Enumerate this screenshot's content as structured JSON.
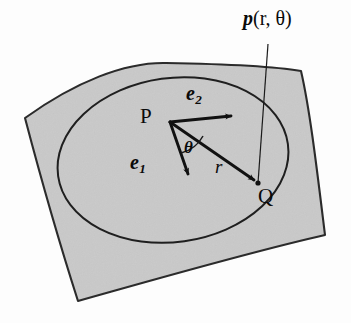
{
  "figure": {
    "kind": "geometry-diagram",
    "background_color": "#fdfdfd",
    "patch_fill_color": "#c9c9c9",
    "stroke_color": "#1a1a1a",
    "labels": {
      "position_vector": {
        "symbol": "p",
        "args": "(r, θ)"
      },
      "point_p": "P",
      "point_q": "Q",
      "basis_vector_1": {
        "symbol": "e",
        "subscript": "1"
      },
      "basis_vector_2": {
        "symbol": "e",
        "subscript": "2"
      },
      "angle": "θ",
      "radius": "r"
    },
    "geometry": {
      "vector_origin": [
        170,
        122
      ],
      "e2_tip": [
        236,
        116
      ],
      "e1_tip": [
        190,
        180
      ],
      "r_tip": [
        259,
        184
      ],
      "leader_line_from": [
        268,
        44
      ],
      "leader_line_to": [
        258,
        183
      ]
    }
  }
}
